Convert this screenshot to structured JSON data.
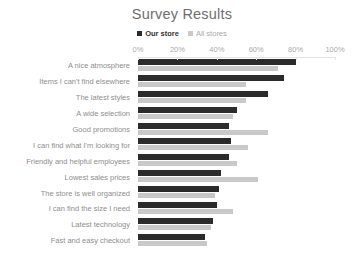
{
  "chart_data": {
    "type": "bar",
    "orientation": "horizontal",
    "title": "Survey Results",
    "xlabel": "",
    "ylabel": "",
    "xlim": [
      0,
      100
    ],
    "x_ticks": [
      "0%",
      "20%",
      "40%",
      "60%",
      "80%",
      "100%"
    ],
    "x_tick_values": [
      0,
      20,
      40,
      60,
      80,
      100
    ],
    "grid": false,
    "legend_position": "top-center",
    "categories": [
      "A nice atmosphere",
      "Items I can't find elsewhere",
      "The latest styles",
      "A wide selection",
      "Good promotions",
      "I can find what I'm looking for",
      "Friendly and helpful employees",
      "Lowest sales prices",
      "The store is well organized",
      "I can find the size I need",
      "Latest technology",
      "Fast and easy checkout"
    ],
    "series": [
      {
        "name": "Our store",
        "color": "#2b2b2b",
        "values": [
          80,
          74,
          66,
          50,
          46,
          47,
          46,
          42,
          41,
          40,
          38,
          34
        ]
      },
      {
        "name": "All stores",
        "color": "#c9c9c9",
        "values": [
          71,
          55,
          55,
          48,
          66,
          56,
          50,
          61,
          39,
          48,
          37,
          35
        ]
      }
    ]
  },
  "colors": {
    "background": "#ffffff",
    "title": "#6e6e6e",
    "category_label": "#8e8e8e",
    "tick_label": "#a9a9a9",
    "axis_line": "#e3e3e3",
    "series_1": "#2b2b2b",
    "series_2": "#c9c9c9"
  }
}
